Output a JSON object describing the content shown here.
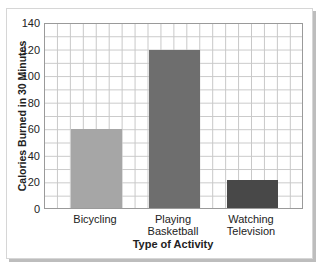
{
  "chart_data": {
    "type": "bar",
    "title": "",
    "xlabel": "Type of Activity",
    "ylabel": "Calories Burned in 30 Minutes",
    "categories": [
      "Bicycling",
      "Playing Basketball",
      "Watching Television"
    ],
    "category_lines": [
      [
        "Bicycling"
      ],
      [
        "Playing",
        "Basketball"
      ],
      [
        "Watching",
        "Television"
      ]
    ],
    "values": [
      60,
      120,
      21
    ],
    "colors": [
      "#a6a6a6",
      "#6e6e6e",
      "#484848"
    ],
    "ylim": [
      0,
      140
    ],
    "yticks": [
      0,
      20,
      40,
      60,
      80,
      100,
      120,
      140
    ],
    "grid": true,
    "minor_grid_step": 10,
    "legend": null
  }
}
